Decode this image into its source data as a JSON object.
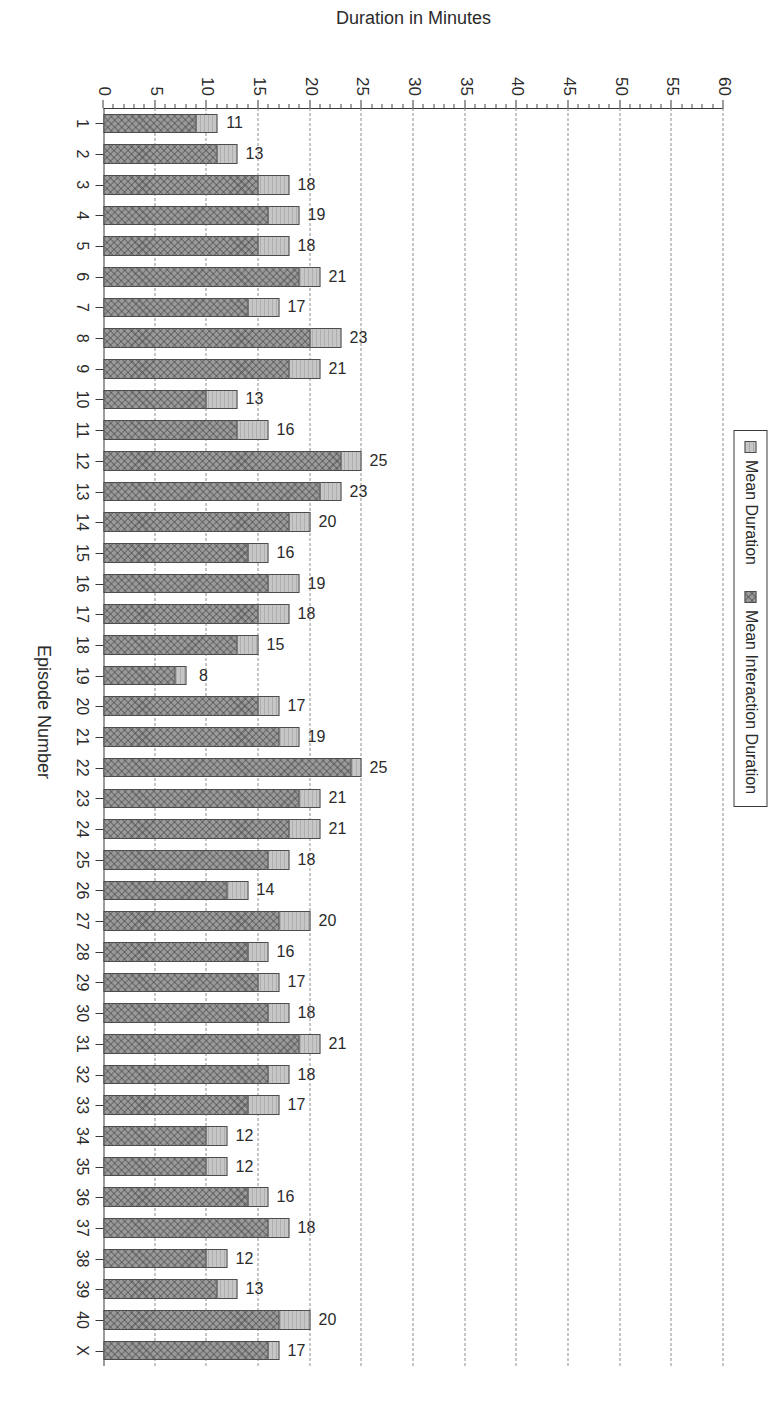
{
  "page_header": {
    "left": "100",
    "right": "Appendix C: graphs and summary tables"
  },
  "legend": {
    "items": [
      {
        "label": "Mean Duration",
        "swatch_color": "#c6c6c6",
        "icon": "legend-swatch-icon"
      },
      {
        "label": "Mean Interaction Duration",
        "swatch_color": "#9a9a9a",
        "icon": "legend-swatch-icon"
      }
    ]
  },
  "chart_data": {
    "type": "bar",
    "title": "",
    "subtitle": "",
    "xlabel": "Episode Number",
    "ylabel": "Duration in Minutes",
    "ylim": [
      0,
      60
    ],
    "ytick_step": 5,
    "yticks": [
      0,
      5,
      10,
      15,
      20,
      25,
      30,
      35,
      40,
      45,
      50,
      55,
      60
    ],
    "ytick_labels": [
      "0",
      "5",
      "10",
      "15",
      "20",
      "25",
      "30",
      "35",
      "40",
      "45",
      "50",
      "55",
      "60"
    ],
    "grid": true,
    "grid_axis": "y",
    "grid_style": "dashed",
    "legend_position": "top-left",
    "orientation": "vertical-stacked",
    "categories": [
      "1",
      "2",
      "3",
      "4",
      "5",
      "6",
      "7",
      "8",
      "9",
      "10",
      "11",
      "12",
      "13",
      "14",
      "15",
      "16",
      "17",
      "18",
      "19",
      "20",
      "21",
      "22",
      "23",
      "24",
      "25",
      "26",
      "27",
      "28",
      "29",
      "30",
      "31",
      "32",
      "33",
      "34",
      "35",
      "36",
      "37",
      "38",
      "39",
      "40",
      "X"
    ],
    "series": [
      {
        "name": "Mean Interaction Duration",
        "color": "#9a9a9a",
        "values": [
          9,
          11,
          15,
          16,
          15,
          19,
          14,
          20,
          18,
          10,
          13,
          23,
          21,
          18,
          14,
          16,
          15,
          13,
          7,
          15,
          17,
          24,
          19,
          18,
          16,
          12,
          17,
          14,
          15,
          16,
          19,
          16,
          14,
          10,
          10,
          14,
          16,
          10,
          11,
          17,
          16
        ]
      },
      {
        "name": "Mean Duration",
        "color": "#c6c6c6",
        "values": [
          11,
          13,
          18,
          19,
          18,
          21,
          17,
          23,
          21,
          13,
          16,
          25,
          23,
          20,
          16,
          19,
          18,
          15,
          8,
          17,
          19,
          25,
          21,
          21,
          18,
          14,
          20,
          16,
          17,
          18,
          21,
          18,
          17,
          12,
          12,
          16,
          18,
          12,
          13,
          20,
          17
        ]
      }
    ],
    "data_labels": [
      "11",
      "13",
      "18",
      "19",
      "18",
      "21",
      "17",
      "23",
      "21",
      "13",
      "16",
      "25",
      "23",
      "20",
      "16",
      "19",
      "18",
      "15",
      "8",
      "17",
      "19",
      "25",
      "21",
      "21",
      "18",
      "14",
      "20",
      "16",
      "17",
      "18",
      "21",
      "18",
      "17",
      "12",
      "12",
      "16",
      "18",
      "12",
      "13",
      "20",
      "17"
    ]
  }
}
